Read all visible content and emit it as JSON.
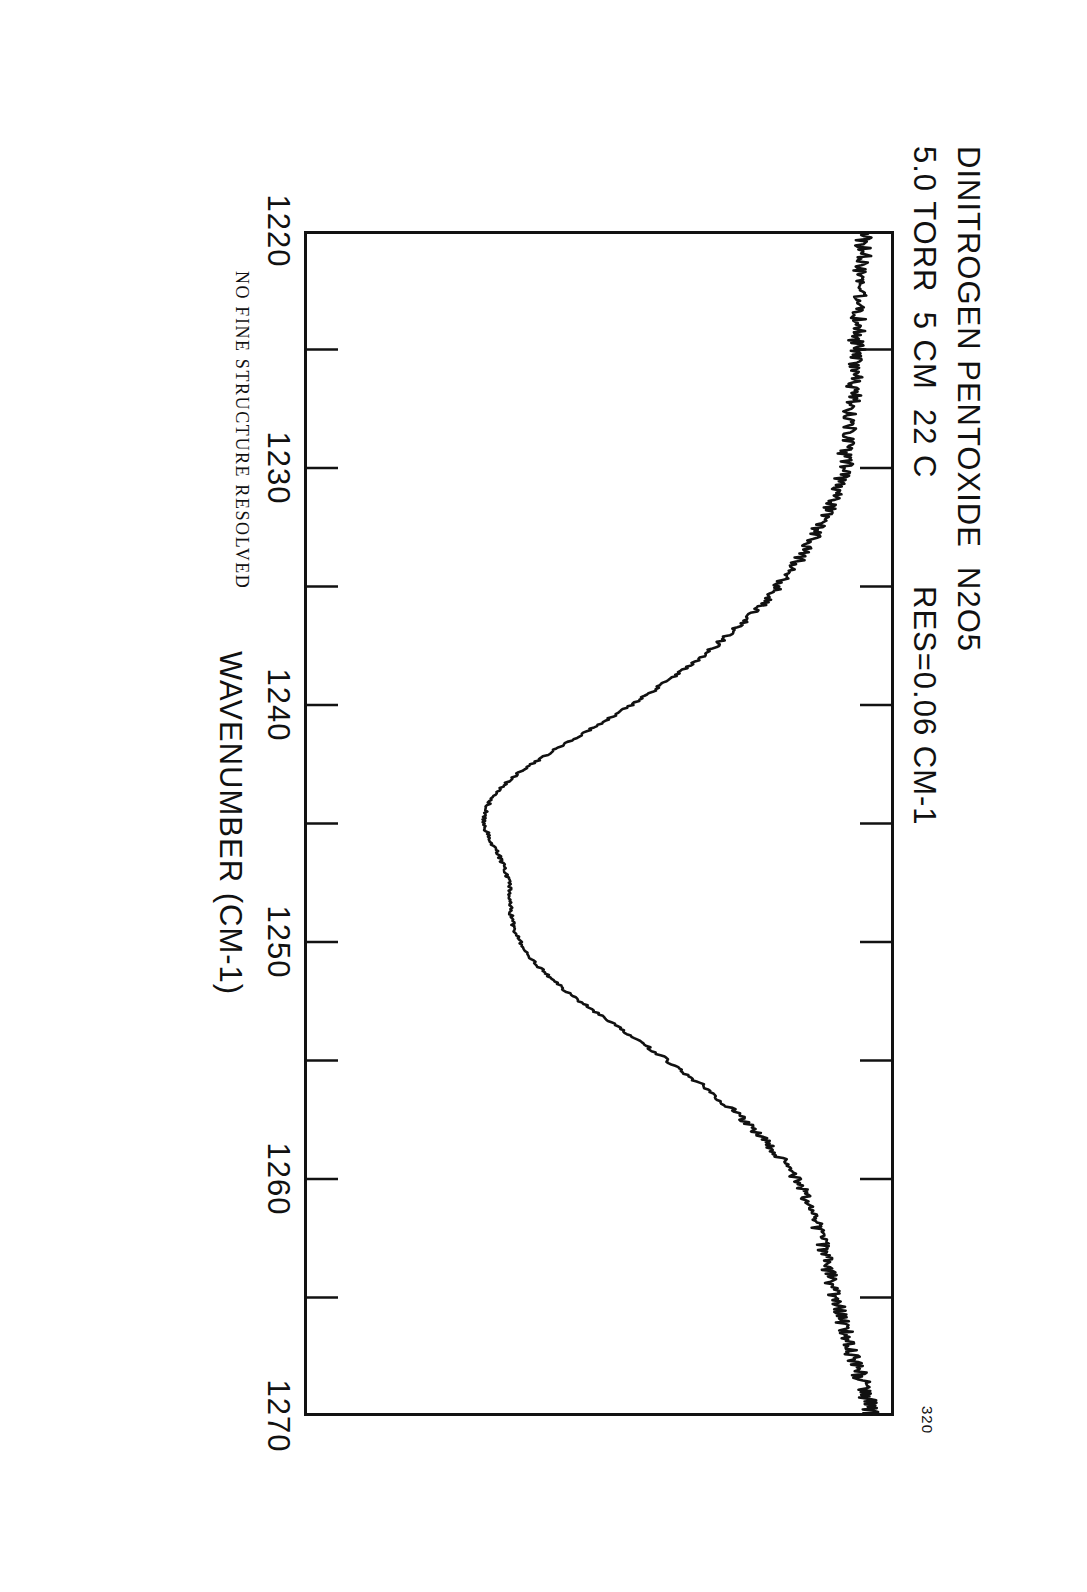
{
  "header": {
    "line1": "DINITROGEN PENTOXIDE  N2O5",
    "line2": "5.0 TORR  5 CM  22 C",
    "resolution": "RES=0.06 CM-1",
    "corner_label": "320"
  },
  "annotation": "NO FINE STRUCTURE RESOLVED",
  "chart_data": {
    "type": "line",
    "title": "DINITROGEN PENTOXIDE  N2O5",
    "subtitle": "5.0 TORR  5 CM  22 C",
    "annotations": [
      "RES=0.06 CM-1",
      "NO FINE STRUCTURE RESOLVED",
      "320"
    ],
    "xlabel": "WAVENUMBER (CM-1)",
    "ylabel": "",
    "xlim": [
      1220,
      1270
    ],
    "ylim": [
      0,
      1
    ],
    "grid": false,
    "legend": null,
    "orientation": "page-rotated-90-clockwise",
    "xticks": [
      1220,
      1225,
      1230,
      1235,
      1240,
      1245,
      1250,
      1255,
      1260,
      1265,
      1270
    ],
    "xtick_labels": [
      "1220",
      "",
      "1230",
      "",
      "1240",
      "",
      "1250",
      "",
      "1260",
      "",
      "1270"
    ],
    "x": [
      1220.0,
      1220.5,
      1221.0,
      1221.5,
      1222.0,
      1222.5,
      1223.0,
      1223.5,
      1224.0,
      1224.5,
      1225.0,
      1225.5,
      1226.0,
      1226.5,
      1227.0,
      1227.5,
      1228.0,
      1228.5,
      1229.0,
      1229.5,
      1230.0,
      1230.5,
      1231.0,
      1231.5,
      1232.0,
      1232.5,
      1233.0,
      1233.5,
      1234.0,
      1234.5,
      1235.0,
      1235.5,
      1236.0,
      1236.5,
      1237.0,
      1237.5,
      1238.0,
      1238.5,
      1239.0,
      1239.5,
      1240.0,
      1240.5,
      1241.0,
      1241.5,
      1242.0,
      1242.5,
      1243.0,
      1243.5,
      1244.0,
      1244.5,
      1245.0,
      1245.5,
      1246.0,
      1246.5,
      1247.0,
      1247.5,
      1248.0,
      1248.5,
      1249.0,
      1249.5,
      1250.0,
      1250.5,
      1251.0,
      1251.5,
      1252.0,
      1252.5,
      1253.0,
      1253.5,
      1254.0,
      1254.5,
      1255.0,
      1255.5,
      1256.0,
      1256.5,
      1257.0,
      1257.5,
      1258.0,
      1258.5,
      1259.0,
      1259.5,
      1260.0,
      1260.5,
      1261.0,
      1261.5,
      1262.0,
      1262.5,
      1263.0,
      1263.5,
      1264.0,
      1264.5,
      1265.0,
      1265.5,
      1266.0,
      1266.5,
      1267.0,
      1267.5,
      1268.0,
      1268.5,
      1269.0,
      1269.5,
      1270.0
    ],
    "y": [
      0.955,
      0.948,
      0.951,
      0.944,
      0.949,
      0.941,
      0.946,
      0.938,
      0.943,
      0.936,
      0.94,
      0.932,
      0.936,
      0.929,
      0.932,
      0.925,
      0.928,
      0.921,
      0.924,
      0.916,
      0.918,
      0.909,
      0.902,
      0.894,
      0.884,
      0.873,
      0.862,
      0.849,
      0.835,
      0.82,
      0.803,
      0.786,
      0.766,
      0.745,
      0.722,
      0.698,
      0.672,
      0.645,
      0.616,
      0.586,
      0.554,
      0.521,
      0.487,
      0.452,
      0.418,
      0.386,
      0.357,
      0.334,
      0.317,
      0.308,
      0.306,
      0.312,
      0.322,
      0.333,
      0.342,
      0.347,
      0.349,
      0.35,
      0.352,
      0.357,
      0.366,
      0.379,
      0.396,
      0.417,
      0.441,
      0.468,
      0.497,
      0.527,
      0.557,
      0.587,
      0.616,
      0.645,
      0.672,
      0.698,
      0.722,
      0.745,
      0.766,
      0.786,
      0.804,
      0.82,
      0.834,
      0.846,
      0.856,
      0.864,
      0.871,
      0.877,
      0.882,
      0.887,
      0.891,
      0.896,
      0.901,
      0.906,
      0.912,
      0.918,
      0.924,
      0.931,
      0.938,
      0.945,
      0.952,
      0.958,
      0.962
    ]
  },
  "axis": {
    "title": "WAVENUMBER (CM-1)",
    "labels": [
      "1220",
      "1230",
      "1240",
      "1250",
      "1260",
      "1270"
    ]
  }
}
